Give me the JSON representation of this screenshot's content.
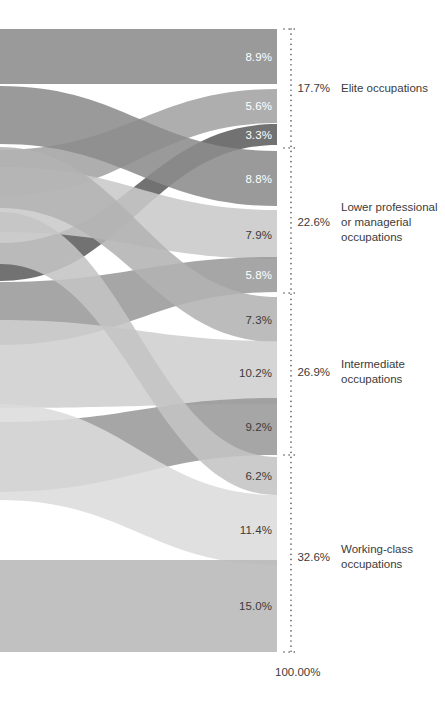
{
  "chart_data": {
    "type": "sankey",
    "title": "",
    "subtitle": "",
    "xlabel": "",
    "ylabel": "",
    "grid": false,
    "legend": "none",
    "axis_total_label": "100.00%",
    "units": "percent",
    "destination_groups": [
      {
        "id": "elite",
        "name": "Elite occupations",
        "total": "17.7%",
        "total_value": 17.7,
        "name_lines": "Elite occupations",
        "y_top": 29,
        "y_bottom": 148,
        "label_y": 88
      },
      {
        "id": "lower-professional",
        "name": "Lower professional or managerial occupations",
        "total": "22.6%",
        "total_value": 22.6,
        "name_lines": "Lower professional\nor managerial\noccupations",
        "y_top": 148,
        "y_bottom": 293,
        "label_y": 222
      },
      {
        "id": "intermediate",
        "name": "Intermediate occupations",
        "total": "26.9%",
        "total_value": 26.9,
        "name_lines": "Intermediate\noccupations",
        "y_top": 293,
        "y_bottom": 455,
        "label_y": 372
      },
      {
        "id": "working-class",
        "name": "Working-class occupations",
        "total": "32.6%",
        "total_value": 32.6,
        "name_lines": "Working-class\noccupations",
        "y_top": 455,
        "y_bottom": 652,
        "label_y": 557
      }
    ],
    "flows": [
      {
        "id": "f1",
        "label": "8.9%",
        "value": 8.9,
        "group": "elite",
        "color": "#8c8c8c",
        "label_on": "dark",
        "dest_top": 29,
        "dest_bottom": 84,
        "src_top": 29,
        "src_bottom": 84
      },
      {
        "id": "f2",
        "label": "5.6%",
        "value": 5.6,
        "group": "elite",
        "color": "#a3a3a3",
        "label_on": "dark",
        "dest_top": 89,
        "dest_bottom": 123,
        "src_top": 150,
        "src_bottom": 196
      },
      {
        "id": "f3",
        "label": "3.3%",
        "value": 3.3,
        "group": "elite",
        "color": "#5e5e5e",
        "label_on": "dark",
        "dest_top": 124,
        "dest_bottom": 145,
        "src_top": 243,
        "src_bottom": 281
      },
      {
        "id": "f4",
        "label": "8.8%",
        "value": 8.8,
        "group": "lower-professional",
        "color": "#8c8c8c",
        "label_on": "dark",
        "dest_top": 151,
        "dest_bottom": 206,
        "src_top": 86,
        "src_bottom": 144
      },
      {
        "id": "f5",
        "label": "7.9%",
        "value": 7.9,
        "group": "lower-professional",
        "color": "#c9c9c9",
        "label_on": "light",
        "dest_top": 210,
        "dest_bottom": 259,
        "src_top": 167,
        "src_bottom": 232
      },
      {
        "id": "f6",
        "label": "5.8%",
        "value": 5.8,
        "group": "lower-professional",
        "color": "#9a9a9a",
        "label_on": "dark",
        "dest_top": 257,
        "dest_bottom": 292,
        "src_top": 282,
        "src_bottom": 345
      },
      {
        "id": "f7",
        "label": "7.3%",
        "value": 7.3,
        "group": "intermediate",
        "color": "#b3b3b3",
        "label_on": "light",
        "dest_top": 297,
        "dest_bottom": 342,
        "src_top": 147,
        "src_bottom": 208
      },
      {
        "id": "f8",
        "label": "10.2%",
        "value": 10.2,
        "group": "intermediate",
        "color": "#cfcfcf",
        "label_on": "light",
        "dest_top": 341,
        "dest_bottom": 404,
        "src_top": 320,
        "src_bottom": 408
      },
      {
        "id": "f9",
        "label": "9.2%",
        "value": 9.2,
        "group": "intermediate",
        "color": "#9a9a9a",
        "label_on": "light",
        "dest_top": 398,
        "dest_bottom": 455,
        "src_top": 422,
        "src_bottom": 492
      },
      {
        "id": "f10",
        "label": "6.2%",
        "value": 6.2,
        "group": "working-class",
        "color": "#c4c4c4",
        "label_on": "light",
        "dest_top": 457,
        "dest_bottom": 495,
        "src_top": 212,
        "src_bottom": 264
      },
      {
        "id": "f11",
        "label": "11.4%",
        "value": 11.4,
        "group": "working-class",
        "color": "#dcdcdc",
        "label_on": "light",
        "dest_top": 495,
        "dest_bottom": 565,
        "src_top": 404,
        "src_bottom": 500
      },
      {
        "id": "f12",
        "label": "15.0%",
        "value": 15.0,
        "group": "working-class",
        "color": "#b8b8b8",
        "label_on": "light",
        "dest_top": 560,
        "dest_bottom": 652,
        "src_top": 560,
        "src_bottom": 652
      }
    ],
    "layout": {
      "flow_left_x": 0,
      "flow_right_x": 277,
      "axis_x": 291,
      "axis_top": 29,
      "axis_bottom": 652,
      "value_label_right_x": 272,
      "group_total_right_x": 330,
      "group_name_left_x": 341,
      "axis_total_x": 275,
      "axis_total_y": 666,
      "tick_half_width": 7,
      "dot_color": "#58585a",
      "text_color": "#3b3b3b"
    }
  }
}
